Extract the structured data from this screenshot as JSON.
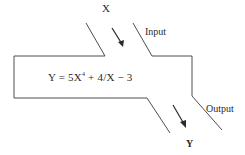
{
  "diagram": {
    "type": "function-machine",
    "input": {
      "variable": "X",
      "label": "Input"
    },
    "output": {
      "variable": "Y",
      "label": "Output"
    },
    "formula": {
      "lhs": "Y",
      "equals": "=",
      "term1_coef": "5X",
      "term1_exp": "4",
      "rest": " + 4/X − 3",
      "full": "Y = 5X^4 + 4/X − 3"
    },
    "colors": {
      "stroke": "#3a3a3a",
      "text": "#2a2a2a",
      "background": "#ffffff"
    }
  }
}
